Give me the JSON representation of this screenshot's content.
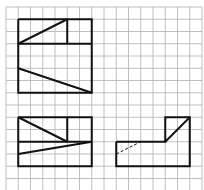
{
  "diagram": {
    "type": "orthographic-projection-views",
    "grid": {
      "x0": 6,
      "y0": 7,
      "cell": 12.25,
      "cols": 16,
      "rows": 15,
      "color": "#b0b0b0"
    },
    "stroke_color": "#111111",
    "views": [
      {
        "name": "front-view",
        "polylines": [
          [
            [
              1,
              1
            ],
            [
              7,
              1
            ],
            [
              7,
              7
            ],
            [
              1,
              7
            ],
            [
              1,
              1
            ]
          ],
          [
            [
              1,
              3
            ],
            [
              7,
              3
            ]
          ],
          [
            [
              5,
              1
            ],
            [
              5,
              3
            ]
          ],
          [
            [
              1,
              3
            ],
            [
              5,
              1
            ]
          ],
          [
            [
              1,
              5
            ],
            [
              7,
              7
            ]
          ]
        ]
      },
      {
        "name": "top-view",
        "polylines": [
          [
            [
              1,
              9
            ],
            [
              7,
              9
            ],
            [
              7,
              13
            ],
            [
              1,
              13
            ],
            [
              1,
              9
            ]
          ],
          [
            [
              1,
              11
            ],
            [
              7,
              11
            ]
          ],
          [
            [
              5,
              9
            ],
            [
              5,
              11
            ]
          ],
          [
            [
              1,
              9
            ],
            [
              5,
              11
            ]
          ],
          [
            [
              1,
              12
            ],
            [
              7,
              11
            ]
          ]
        ]
      },
      {
        "name": "side-view",
        "polylines": [
          [
            [
              9,
              11
            ],
            [
              13,
              11
            ],
            [
              13,
              9
            ],
            [
              15,
              9
            ],
            [
              15,
              13
            ],
            [
              9,
              13
            ],
            [
              9,
              11
            ]
          ],
          [
            [
              13,
              11
            ],
            [
              15,
              9
            ]
          ]
        ],
        "hidden": [
          [
            [
              9,
              12
            ],
            [
              11,
              11
            ]
          ]
        ]
      }
    ]
  }
}
